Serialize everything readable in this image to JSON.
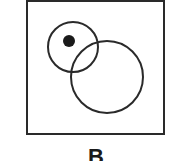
{
  "diagram": {
    "type": "venn",
    "label": "B",
    "frame": {
      "x": 27,
      "y": 1,
      "width": 137,
      "height": 133
    },
    "circles": [
      {
        "name": "small-circle",
        "cx": 73,
        "cy": 47,
        "r": 25
      },
      {
        "name": "large-circle",
        "cx": 107,
        "cy": 77,
        "r": 36
      }
    ],
    "dot": {
      "cx": 69,
      "cy": 41,
      "r": 6
    },
    "colors": {
      "stroke": "#2a2a2a",
      "fill": "#1a1a1a",
      "background": "#ffffff"
    }
  }
}
